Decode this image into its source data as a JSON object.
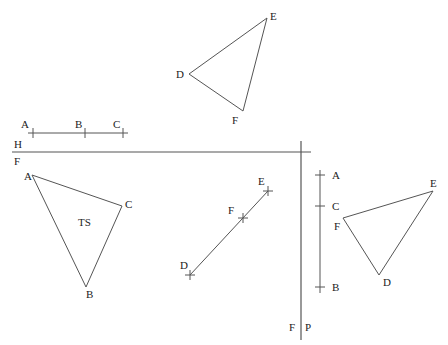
{
  "labels": {
    "top_triangle": {
      "D": "D",
      "E": "E",
      "F": "F"
    },
    "horizontal_segment": {
      "A": "A",
      "B": "B",
      "C": "C"
    },
    "hf_axis": {
      "upper": "H",
      "lower": "F"
    },
    "front_triangle": {
      "A": "A",
      "B": "B",
      "C": "C",
      "center": "TS"
    },
    "edge_line": {
      "D": "D",
      "E": "E",
      "F": "F"
    },
    "vertical_segment": {
      "A": "A",
      "C": "C",
      "B": "B"
    },
    "fp_axis": {
      "left": "F",
      "right": "P"
    },
    "right_triangle": {
      "D": "D",
      "E": "E",
      "F": "F"
    }
  },
  "colors": {
    "line": "#555555",
    "text": "#222222",
    "background": "#ffffff"
  }
}
